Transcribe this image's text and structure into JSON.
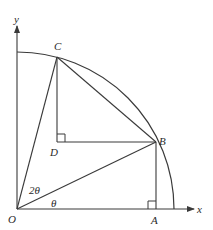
{
  "diagram": {
    "type": "geometry",
    "colors": {
      "stroke": "#3a3a3a",
      "text": "#2a2a2a",
      "background": "#ffffff"
    },
    "axes": {
      "x_label": "x",
      "y_label": "y"
    },
    "points": {
      "O": "O",
      "A": "A",
      "B": "B",
      "C": "C",
      "D": "D"
    },
    "angles": {
      "angle_AOB": "θ",
      "angle_BOC": "2θ"
    },
    "segments": [
      "OA",
      "OB",
      "OC",
      "AB",
      "BC",
      "CD",
      "DB"
    ],
    "right_angles": [
      "at A (between OA and AB)",
      "at D (between CD and DB)"
    ],
    "arc": "quarter circle from y-axis to x-axis through B and C"
  }
}
